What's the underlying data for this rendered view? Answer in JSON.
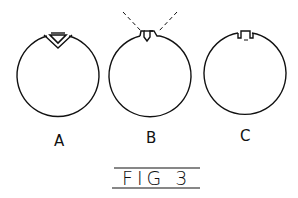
{
  "figure": {
    "caption": "FIG 3",
    "panels": [
      {
        "id": "A",
        "label": "A",
        "notch": "v-notch-with-triangular-insert"
      },
      {
        "id": "B",
        "label": "B",
        "notch": "stepped-notch-with-dashed-guides"
      },
      {
        "id": "C",
        "label": "C",
        "notch": "rectangular-slot"
      }
    ]
  },
  "colors": {
    "stroke": "#111111",
    "background": "#ffffff"
  }
}
